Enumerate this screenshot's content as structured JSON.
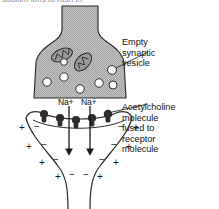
{
  "figure": {
    "title_fragment": "sodium ions to rush in",
    "type": "synapse-diagram",
    "colors": {
      "cytoplasm_fill": "#b6b6b6",
      "outline": "#1a1a1a",
      "vesicle_fill": "#ffffff",
      "receptor_fill": "#2a2a2a",
      "background": "#ffffff",
      "clipped_text": "#8a8a8a"
    }
  },
  "labels": {
    "vesicle": "Empty\nsynaptic\nvesicle",
    "vesicle_lines": [
      "Empty",
      "synaptic",
      "vesicle"
    ],
    "acetylcholine": "Acetylcholine\nmolecule\nfused to\nreceptor\nmolecule",
    "acetylcholine_lines": [
      "Acetylcholine",
      "molecule",
      "fused to",
      "receptor",
      "molecule"
    ]
  },
  "ions": {
    "left": "Na+",
    "right": "Na+",
    "symbol": "Na",
    "charge": "+",
    "count": 2
  },
  "structures": {
    "presynaptic_terminal": "presynaptic axon terminal",
    "mitochondria_count": 2,
    "vesicle_count": 7,
    "receptor_count": 5,
    "arrow_count": 2,
    "postsynaptic_cell": "postsynaptic membrane / muscle fibre"
  },
  "charges": {
    "outer_symbol": "+",
    "inner_symbol": "−",
    "left_pairs": 4,
    "right_pairs": 4,
    "bottom_sequence": [
      "+",
      "−",
      "−",
      "+"
    ],
    "description": "depolarised membrane: positive outside, negative inside"
  },
  "geometry": {
    "vesicles": [
      {
        "cx": 47,
        "cy": 82,
        "r": 4.2
      },
      {
        "cx": 64,
        "cy": 77,
        "r": 4.2
      },
      {
        "cx": 80,
        "cy": 89,
        "r": 4.2
      },
      {
        "cx": 99,
        "cy": 83,
        "r": 4.2
      },
      {
        "cx": 112,
        "cy": 70,
        "r": 4.4
      },
      {
        "cx": 113,
        "cy": 85,
        "r": 4.0
      },
      {
        "cx": 64,
        "cy": 62,
        "r": 3.4
      }
    ],
    "mitochondria": [
      {
        "cx": 62,
        "cy": 55,
        "rx": 11,
        "ry": 6,
        "rot": -22
      },
      {
        "cx": 83,
        "cy": 62,
        "rx": 10.5,
        "ry": 6.5,
        "rot": -48
      }
    ],
    "receptors": [
      {
        "x": 44,
        "y": 117
      },
      {
        "x": 60,
        "y": 120
      },
      {
        "x": 76,
        "y": 121
      },
      {
        "x": 92,
        "y": 120
      },
      {
        "x": 107,
        "y": 116
      }
    ],
    "arrows": [
      {
        "x": 69,
        "y0": 106,
        "y1": 152
      },
      {
        "x": 90,
        "y0": 106,
        "y1": 152
      }
    ],
    "charge_marks_left": [
      {
        "plus_x": 22,
        "minus_x": 36,
        "y": 130
      },
      {
        "plus_x": 27,
        "minus_x": 41,
        "y": 148
      },
      {
        "plus_x": 37,
        "minus_x": 50,
        "y": 163
      },
      {
        "plus_x": 52,
        "minus_x": 64,
        "y": 177
      }
    ],
    "charge_marks_right": [
      {
        "minus_x": 120,
        "plus_x": 133,
        "y": 130
      },
      {
        "minus_x": 114,
        "plus_x": 128,
        "y": 148
      },
      {
        "minus_x": 104,
        "plus_x": 118,
        "y": 163
      },
      {
        "minus_x": 90,
        "plus_x": 103,
        "y": 177
      }
    ]
  }
}
